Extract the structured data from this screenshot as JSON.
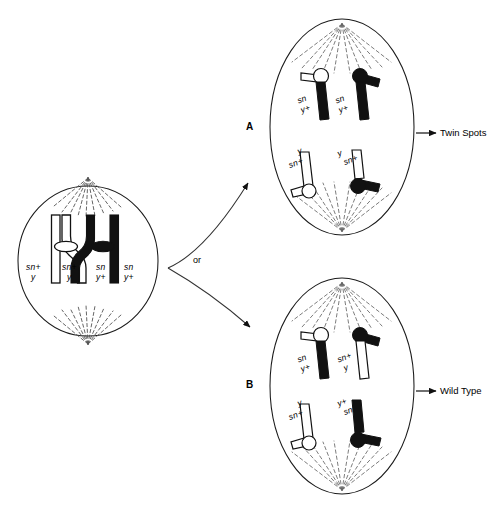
{
  "figure": {
    "type": "biology-cell-diagram",
    "background": "#ffffff",
    "ink": "#000000"
  },
  "parent_cell": {
    "name": "parent-cell",
    "shape": "ellipse",
    "stage": "metaphase with crossover",
    "spindle": "radiating dashed fibers from top and bottom poles",
    "chromatids": [
      {
        "id": 1,
        "fill": "white",
        "top_allele": "sn+",
        "bottom_allele": "y"
      },
      {
        "id": 2,
        "fill": "white",
        "top_allele": "sn+",
        "bottom_allele": "y"
      },
      {
        "id": 3,
        "fill": "black",
        "top_allele": "sn",
        "bottom_allele": "y+"
      },
      {
        "id": 4,
        "fill": "black",
        "top_allele": "sn",
        "bottom_allele": "y+"
      }
    ],
    "crossover_between": [
      2,
      3
    ]
  },
  "branch": {
    "or_label": "or"
  },
  "cell_A": {
    "letter": "A",
    "outcome": "Twin Spots",
    "chromosomes": [
      {
        "position": "top-left",
        "arm_fill": "black",
        "knob_fill": "white",
        "allele_top": "sn",
        "allele_bottom": "y+"
      },
      {
        "position": "top-right",
        "arm_fill": "black",
        "knob_fill": "black",
        "allele_top": "sn",
        "allele_bottom": "y+"
      },
      {
        "position": "bottom-left",
        "arm_fill": "white",
        "knob_fill": "white",
        "allele_top": "y",
        "allele_bottom": "sn+"
      },
      {
        "position": "bottom-right",
        "arm_fill": "white",
        "knob_fill": "black",
        "allele_top": "y",
        "allele_bottom": "sn+"
      }
    ]
  },
  "cell_B": {
    "letter": "B",
    "outcome": "Wild Type",
    "chromosomes": [
      {
        "position": "top-left",
        "arm_fill": "black",
        "knob_fill": "white",
        "allele_top": "sn",
        "allele_bottom": "y+"
      },
      {
        "position": "top-right",
        "arm_fill": "white",
        "knob_fill": "black",
        "allele_top": "sn+",
        "allele_bottom": "y"
      },
      {
        "position": "bottom-left",
        "arm_fill": "white",
        "knob_fill": "white",
        "allele_top": "y",
        "allele_bottom": "sn+"
      },
      {
        "position": "bottom-right",
        "arm_fill": "black",
        "knob_fill": "black",
        "allele_top": "y+",
        "allele_bottom": "sn"
      }
    ]
  }
}
